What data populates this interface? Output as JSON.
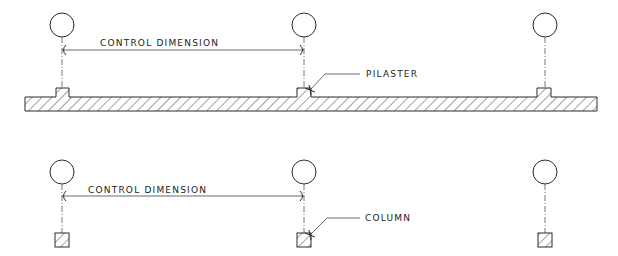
{
  "diagram": {
    "panels": [
      {
        "id": "pilaster-plan",
        "dimension_label": "CONTROL DIMENSION",
        "callout_label": "PILASTER",
        "element_type": "pilaster",
        "grid_count": 3
      },
      {
        "id": "column-plan",
        "dimension_label": "CONTROL DIMENSION",
        "callout_label": "COLUMN",
        "element_type": "column",
        "grid_count": 3
      }
    ],
    "colors": {
      "line": "#2a2a2a",
      "background": "#ffffff"
    }
  }
}
